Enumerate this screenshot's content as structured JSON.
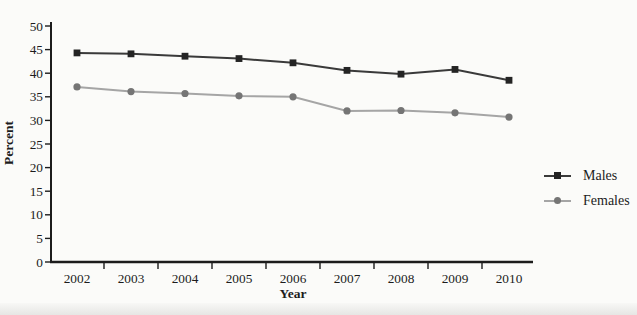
{
  "figure": {
    "background_color": "#fbfbf9",
    "axis_color": "#1c1c1c"
  },
  "chart_data": {
    "type": "line",
    "title": "",
    "xlabel": "Year",
    "ylabel": "Percent",
    "categories": [
      "2002",
      "2003",
      "2004",
      "2005",
      "2006",
      "2007",
      "2008",
      "2009",
      "2010"
    ],
    "series": [
      {
        "name": "Males",
        "marker": "square",
        "marker_color": "#242424",
        "line_color": "#3a3a3a",
        "values": [
          44.3,
          44.1,
          43.6,
          43.1,
          42.2,
          40.6,
          39.8,
          40.8,
          38.5
        ]
      },
      {
        "name": "Females",
        "marker": "circle",
        "marker_color": "#757575",
        "line_color": "#a5a5a5",
        "values": [
          37.1,
          36.1,
          35.7,
          35.2,
          35.0,
          32.0,
          32.1,
          31.6,
          30.7
        ]
      }
    ],
    "ylim": [
      0,
      50
    ],
    "yticks": [
      0,
      5,
      10,
      15,
      20,
      25,
      30,
      35,
      40,
      45,
      50
    ],
    "grid": false,
    "legend_position": "right-middle"
  }
}
